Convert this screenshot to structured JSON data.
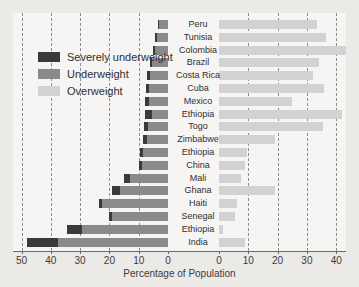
{
  "chart_data": {
    "type": "bar",
    "subtype": "diverging-stacked-horizontal",
    "title": "",
    "xlabel": "Percentage of Population",
    "ylabel": "",
    "grid": true,
    "legend_position": "upper-left",
    "left_axis": {
      "name": "Underweight side",
      "ticks": [
        50,
        40,
        30,
        20,
        10,
        0
      ],
      "range": [
        50,
        0
      ],
      "direction": "right-to-left"
    },
    "right_axis": {
      "name": "Overweight side",
      "ticks": [
        0,
        10,
        20,
        30,
        40
      ],
      "range": [
        0,
        45
      ],
      "direction": "left-to-right"
    },
    "series": [
      {
        "name": "Severely underweight",
        "color": "#3a3a3a",
        "side": "left"
      },
      {
        "name": "Underweight",
        "color": "#8a8a8a",
        "side": "left"
      },
      {
        "name": "Overweight",
        "color": "#d2d2d2",
        "side": "right"
      }
    ],
    "categories": [
      "Peru",
      "Tunisia",
      "Colombia",
      "Brazil",
      "Costa Rica",
      "Cuba",
      "Mexico",
      "Ethiopia",
      "Togo",
      "Zimbabwe",
      "Ethiopia",
      "China",
      "Mali",
      "Ghana",
      "Haiti",
      "Senegal",
      "Ethiopia",
      "India"
    ],
    "rows": [
      {
        "country": "Peru",
        "severely_underweight": 0.5,
        "underweight": 3.5,
        "overweight": 33.5
      },
      {
        "country": "Tunisia",
        "severely_underweight": 0.7,
        "underweight": 4.3,
        "overweight": 36.5
      },
      {
        "country": "Colombia",
        "severely_underweight": 0.8,
        "underweight": 5.2,
        "overweight": 43.5
      },
      {
        "country": "Brazil",
        "severely_underweight": 0.8,
        "underweight": 6.2,
        "overweight": 34.0
      },
      {
        "country": "Costa Rica",
        "severely_underweight": 1.0,
        "underweight": 7.0,
        "overweight": 32.0
      },
      {
        "country": "Cuba",
        "severely_underweight": 1.0,
        "underweight": 7.5,
        "overweight": 36.0
      },
      {
        "country": "Mexico",
        "severely_underweight": 1.2,
        "underweight": 7.8,
        "overweight": 25.0
      },
      {
        "country": "Ethiopia",
        "severely_underweight": 2.5,
        "underweight": 8.0,
        "overweight": 42.0
      },
      {
        "country": "Togo",
        "severely_underweight": 1.3,
        "underweight": 8.2,
        "overweight": 35.5
      },
      {
        "country": "Zimbabwe",
        "severely_underweight": 1.2,
        "underweight": 8.5,
        "overweight": 19.0
      },
      {
        "country": "Ethiopia",
        "severely_underweight": 1.0,
        "underweight": 9.5,
        "overweight": 9.5
      },
      {
        "country": "China",
        "severely_underweight": 1.0,
        "underweight": 9.8,
        "overweight": 8.8
      },
      {
        "country": "Mali",
        "severely_underweight": 2.0,
        "underweight": 15.0,
        "overweight": 7.5
      },
      {
        "country": "Ghana",
        "severely_underweight": 2.5,
        "underweight": 19.0,
        "overweight": 19.0
      },
      {
        "country": "Haiti",
        "severely_underweight": 1.0,
        "underweight": 23.5,
        "overweight": 6.0
      },
      {
        "country": "Senegal",
        "severely_underweight": 0.8,
        "underweight": 20.0,
        "overweight": 5.5
      },
      {
        "country": "Ethiopia",
        "severely_underweight": 5.0,
        "underweight": 34.5,
        "overweight": 1.5
      },
      {
        "country": "India",
        "severely_underweight": 10.5,
        "underweight": 48.0,
        "overweight": 8.8
      }
    ]
  },
  "legend": {
    "items": [
      {
        "label": "Severely underweight",
        "color": "#3a3a3a"
      },
      {
        "label": "Underweight",
        "color": "#8a8a8a"
      },
      {
        "label": "Overweight",
        "color": "#d2d2d2"
      }
    ]
  }
}
